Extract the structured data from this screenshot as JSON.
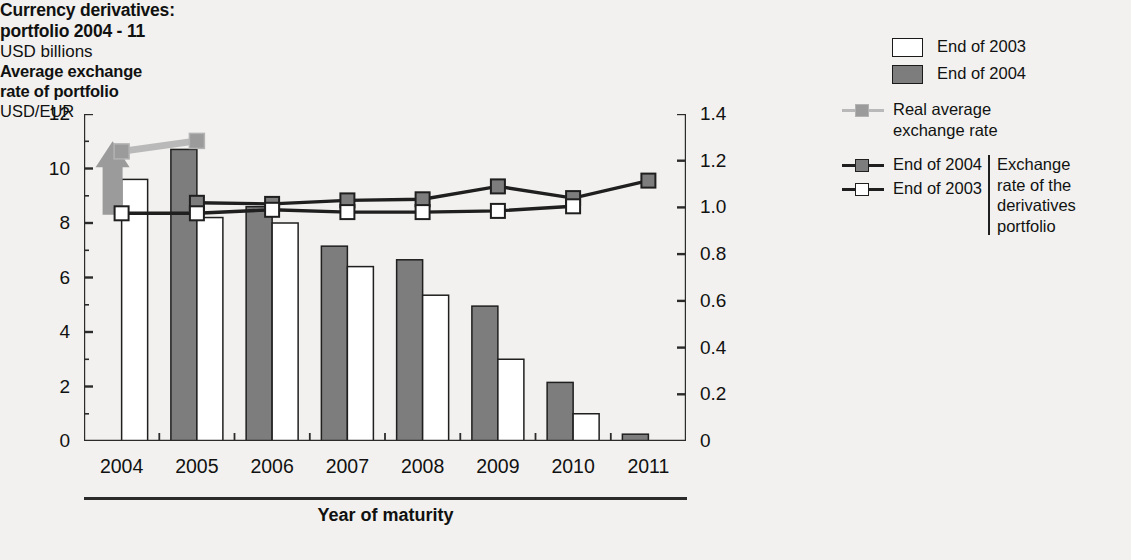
{
  "title": {
    "line1": "Currency derivatives:",
    "line2": "portfolio 2004 - 11",
    "units": "USD billions"
  },
  "secondary_axis_title": {
    "line1": "Average exchange",
    "line2": "rate of portfolio",
    "units": "USD/EUR"
  },
  "legend": {
    "bars": [
      {
        "label": "End of 2003",
        "swatch": "white-box",
        "color": "#ffffff"
      },
      {
        "label": "End of 2004",
        "swatch": "gray-box",
        "color": "#7d7d7d"
      }
    ],
    "real_average": {
      "label_line1": "Real average",
      "label_line2": "exchange rate",
      "color": "#b9b9b9"
    },
    "exchange_rate_lines": [
      {
        "label": "End of 2004",
        "color": "#1f1f1f",
        "marker": "gray-square"
      },
      {
        "label": "End of 2003",
        "color": "#1f1f1f",
        "marker": "white-square"
      }
    ],
    "brace_text": [
      "Exchange",
      "rate of the",
      "derivatives",
      "portfolio"
    ]
  },
  "chart_data": {
    "type": "bar",
    "title": "Currency derivatives: portfolio 2004 - 11",
    "subtitle": "USD billions",
    "xlabel": "Year of maturity",
    "ylabel": "USD billions",
    "y2label": "USD/EUR",
    "categories": [
      "2004",
      "2005",
      "2006",
      "2007",
      "2008",
      "2009",
      "2010",
      "2011"
    ],
    "ylim": [
      0,
      12
    ],
    "yticks": [
      0,
      2,
      4,
      6,
      8,
      10,
      12
    ],
    "ytick_labels": [
      "0",
      "2",
      "4",
      "6",
      "8",
      "10",
      "12"
    ],
    "y2lim": [
      0,
      1.4
    ],
    "y2ticks": [
      0,
      0.2,
      0.4,
      0.6,
      0.8,
      1.0,
      1.2,
      1.4
    ],
    "y2tick_labels": [
      "0",
      "0.2",
      "0.4",
      "0.6",
      "0.8",
      "1.0",
      "1.2",
      "1.4"
    ],
    "grid": false,
    "legend_position": "right",
    "series": [
      {
        "name": "End of 2004",
        "kind": "bar",
        "axis": "left",
        "color": "#7d7d7d",
        "values": [
          null,
          10.7,
          8.6,
          7.15,
          6.65,
          4.95,
          2.15,
          0.25
        ]
      },
      {
        "name": "End of 2003",
        "kind": "bar",
        "axis": "left",
        "color": "#ffffff",
        "values": [
          9.6,
          8.2,
          8.0,
          6.4,
          5.35,
          3.0,
          1.0,
          null
        ]
      },
      {
        "name": "Real average exchange rate",
        "kind": "line",
        "axis": "right",
        "color": "#b9b9b9",
        "marker": "gray-square",
        "values": [
          1.24,
          1.285,
          null,
          null,
          null,
          null,
          null,
          null
        ]
      },
      {
        "name": "Exchange rate of the derivatives portfolio, End of 2004",
        "kind": "line",
        "axis": "right",
        "color": "#1f1f1f",
        "marker": "gray-square",
        "values": [
          null,
          1.02,
          1.015,
          1.03,
          1.035,
          1.09,
          1.04,
          1.115
        ]
      },
      {
        "name": "Exchange rate of the derivatives portfolio, End of 2003",
        "kind": "line",
        "axis": "right",
        "color": "#1f1f1f",
        "marker": "white-square",
        "values": [
          0.975,
          0.975,
          0.99,
          0.98,
          0.98,
          0.985,
          1.005,
          null
        ]
      }
    ],
    "annotations": [
      {
        "type": "arrow",
        "direction": "up",
        "at_category": "2004",
        "from": 8.3,
        "to": 11.0,
        "color": "#9b9b9b"
      }
    ]
  }
}
